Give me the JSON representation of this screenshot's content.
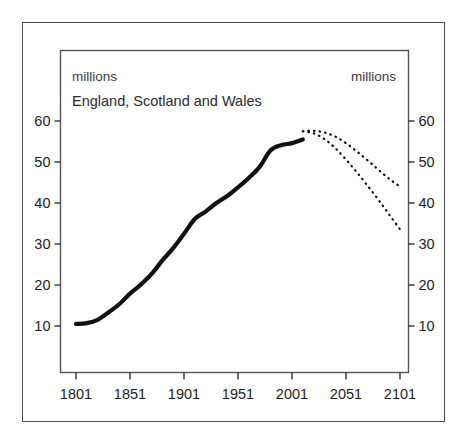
{
  "figure": {
    "units_label_left": "millions",
    "units_label_right": "millions",
    "series_note": "England, Scotland and Wales"
  },
  "chart_data": {
    "type": "line",
    "title": "",
    "subtitle": "England, Scotland and Wales",
    "xlabel": "",
    "ylabel": "millions",
    "ylabel_right": "millions",
    "xlim": [
      1801,
      2101
    ],
    "ylim": [
      0,
      65
    ],
    "yticks": [
      10,
      20,
      30,
      40,
      50,
      60
    ],
    "xticks": [
      1801,
      1851,
      1901,
      1951,
      2001,
      2051,
      2101
    ],
    "grid": false,
    "legend": "none",
    "units": "millions",
    "series": [
      {
        "name": "Population (estimates)",
        "style": "solid",
        "line_width": 4.2,
        "color": "#111111",
        "x": [
          1801,
          1811,
          1821,
          1831,
          1841,
          1851,
          1861,
          1871,
          1881,
          1891,
          1901,
          1911,
          1921,
          1931,
          1941,
          1951,
          1961,
          1971,
          1981,
          1991,
          2001,
          2011
        ],
        "values": [
          10.5,
          10.7,
          11.5,
          13.3,
          15.3,
          17.9,
          20.1,
          22.7,
          26.0,
          29.0,
          32.5,
          36.1,
          37.9,
          40.0,
          41.7,
          43.8,
          46.1,
          48.8,
          52.8,
          54.1,
          54.6,
          55.5
        ]
      },
      {
        "name": "Projection (high)",
        "style": "dotted",
        "line_width": 2.2,
        "color": "#111111",
        "x": [
          2011,
          2021,
          2031,
          2041,
          2051,
          2061,
          2071,
          2081,
          2091,
          2101
        ],
        "values": [
          57.5,
          57.6,
          57.2,
          56.2,
          54.6,
          52.6,
          50.4,
          48.1,
          45.9,
          44.0
        ]
      },
      {
        "name": "Projection (low)",
        "style": "dotted",
        "line_width": 2.2,
        "color": "#111111",
        "x": [
          2011,
          2021,
          2031,
          2041,
          2051,
          2061,
          2071,
          2081,
          2091,
          2101
        ],
        "values": [
          57.5,
          57.0,
          55.6,
          53.4,
          50.6,
          47.5,
          44.2,
          40.8,
          37.2,
          33.6
        ]
      }
    ],
    "annotations": [
      {
        "text": "millions",
        "position": "top-left-inside"
      },
      {
        "text": "millions",
        "position": "top-right-inside"
      },
      {
        "text": "England, Scotland and Wales",
        "position": "upper-left-inside"
      }
    ]
  },
  "axes": {
    "left_ticks": [
      "60",
      "50",
      "40",
      "30",
      "20",
      "10"
    ],
    "right_ticks": [
      "60",
      "50",
      "40",
      "30",
      "20",
      "10"
    ],
    "bottom_ticks": [
      "1801",
      "1851",
      "1901",
      "1951",
      "2001",
      "2051",
      "2101"
    ]
  },
  "colors": {
    "line": "#111111",
    "frame": "#4a4a4a",
    "plot_frame": "#555555",
    "text": "#1c1c1c",
    "background": "#ffffff"
  }
}
